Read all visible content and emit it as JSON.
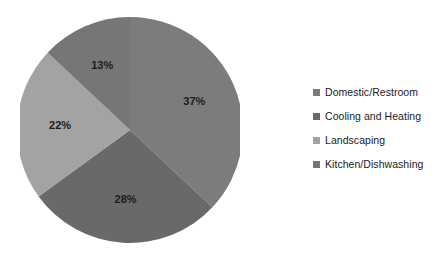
{
  "chart_data": {
    "type": "pie",
    "title": "",
    "subtitle": "",
    "xlabel": "",
    "ylabel": "",
    "grid": false,
    "legend_position": "right",
    "start_angle_deg": 0,
    "direction": "clockwise",
    "categories": [
      "Domestic/Restroom",
      "Cooling and Heating",
      "Landscaping",
      "Kitchen/Dishwashing"
    ],
    "values": [
      37,
      28,
      22,
      13
    ],
    "data_labels": [
      "37%",
      "28%",
      "22%",
      "13%"
    ],
    "colors": [
      "#7c7c7c",
      "#696969",
      "#a3a3a3",
      "#767676"
    ]
  },
  "legend": {
    "items": [
      {
        "label": "Domestic/Restroom",
        "color": "#7c7c7c",
        "swatch": "legend-swatch-icon"
      },
      {
        "label": "Cooling and Heating",
        "color": "#696969",
        "swatch": "legend-swatch-icon"
      },
      {
        "label": "Landscaping",
        "color": "#a3a3a3",
        "swatch": "legend-swatch-icon"
      },
      {
        "label": "Kitchen/Dishwashing",
        "color": "#767676",
        "swatch": "legend-swatch-icon"
      }
    ]
  },
  "labels": {
    "slice_0": "37%",
    "slice_1": "28%",
    "slice_2": "22%",
    "slice_3": "13%"
  }
}
